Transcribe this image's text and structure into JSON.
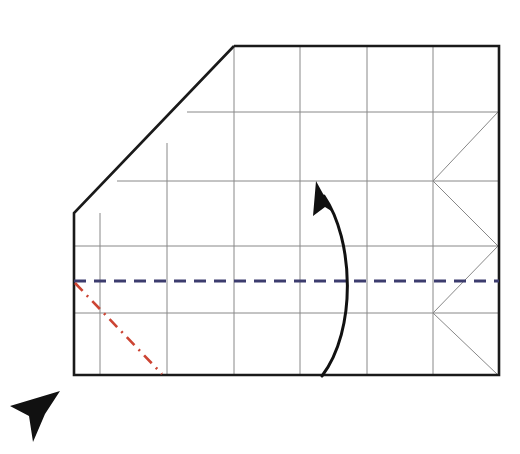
{
  "figure": {
    "kind": "origami-crease-pattern-diagram",
    "canvas": {
      "width": 520,
      "height": 454
    },
    "background_color": "#ffffff"
  },
  "colors": {
    "paper_outline": "#1a1a1a",
    "crease_grid": "#888888",
    "mountain_or_valley_dashed": "#3c3c6e",
    "dash_dot_red": "#cc4433",
    "fold_arrow": "#111111",
    "cursor": "#111111",
    "paper_fill": "#ffffff"
  },
  "paper": {
    "name": "paper-sheet",
    "description": "Rectangular sheet with the upper-left corner cut off by a long diagonal edge",
    "stroke_width": 2.6,
    "outline_points": [
      [
        234,
        46
      ],
      [
        499,
        46
      ],
      [
        499,
        375
      ],
      [
        74,
        375
      ],
      [
        74,
        213
      ],
      [
        234,
        46
      ]
    ]
  },
  "grid": {
    "name": "crease-grid",
    "stroke_width": 1.0,
    "vertical_lines": [
      {
        "x": 100,
        "y1": 213,
        "y2": 375
      },
      {
        "x": 167,
        "y1": 143,
        "y2": 375
      },
      {
        "x": 234,
        "y1": 46,
        "y2": 375
      },
      {
        "x": 300,
        "y1": 46,
        "y2": 375
      },
      {
        "x": 367,
        "y1": 46,
        "y2": 375
      },
      {
        "x": 433,
        "y1": 46,
        "y2": 375
      }
    ],
    "horizontal_lines": [
      {
        "y": 112,
        "x1": 187,
        "x2": 499
      },
      {
        "y": 181,
        "x1": 117,
        "x2": 499
      },
      {
        "y": 246,
        "x1": 74,
        "x2": 499
      },
      {
        "y": 313,
        "x1": 74,
        "x2": 499
      }
    ]
  },
  "fan_creases": {
    "name": "right-edge-zigzag-creases",
    "stroke_width": 1.0,
    "description": "Zigzag diagonal creases alternating between the inner vertical at x=433 and the right edge at x=499",
    "polyline": [
      [
        498,
        112
      ],
      [
        433,
        181
      ],
      [
        498,
        246
      ],
      [
        433,
        313
      ],
      [
        498,
        375
      ]
    ]
  },
  "dashed_fold_line": {
    "name": "valley-fold-dashed-line",
    "color": "#3c3c6e",
    "stroke_width": 3.0,
    "dash_pattern": "12 8",
    "from": [
      74,
      281
    ],
    "to": [
      499,
      281
    ]
  },
  "dash_dot_line": {
    "name": "mountain-fold-dash-dot-line",
    "color": "#cc4433",
    "stroke_width": 2.6,
    "dash_pattern": "11 6 2 6",
    "from": [
      75,
      283
    ],
    "to": [
      162,
      374
    ]
  },
  "fold_arrow": {
    "name": "fold-direction-curved-arrow",
    "color": "#111111",
    "stroke_width": 3.0,
    "curve": {
      "start": [
        322,
        376
      ],
      "control1": [
        357,
        330
      ],
      "control2": [
        354,
        240
      ],
      "end": [
        324,
        196
      ]
    },
    "head_points": [
      [
        316,
        181
      ],
      [
        333,
        212
      ],
      [
        325,
        207
      ],
      [
        313,
        216
      ]
    ]
  },
  "cursor": {
    "name": "mouse-cursor-pointer",
    "color": "#111111",
    "points": [
      [
        60,
        391
      ],
      [
        10,
        406
      ],
      [
        29,
        416
      ],
      [
        33,
        442
      ],
      [
        45,
        414
      ],
      [
        60,
        391
      ]
    ]
  }
}
